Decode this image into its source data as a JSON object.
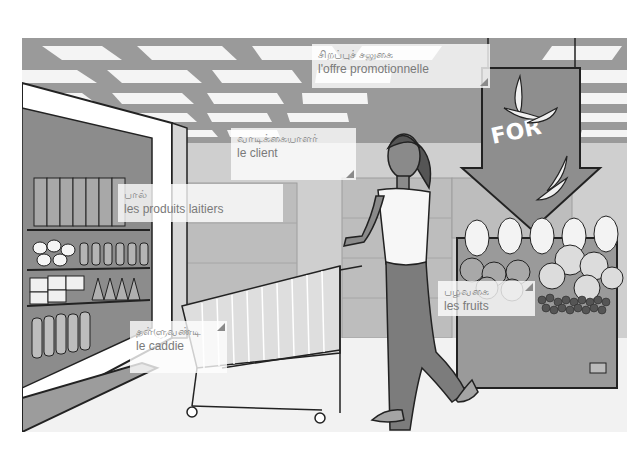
{
  "scene": {
    "description": "Supermarket illustration: woman pushing a shopping trolley past a dairy fridge and a fruit display under a promotional arrow sign",
    "sign_text": "FOR",
    "colors": {
      "ceiling_dark": "#9a9a9a",
      "ceiling_light": "#f4f4f4",
      "floor": "#f0f0f0",
      "shelf": "#8c8c8c",
      "sign": "#8e8e8e",
      "outline": "#222222"
    }
  },
  "labels": [
    {
      "id": "promo",
      "tamil": "சிறப்புச் சலுகை",
      "french": "l'offre promotionnelle",
      "x": 312,
      "y": 44,
      "w": 178,
      "h": 44
    },
    {
      "id": "client",
      "tamil": "வாடிக்கையாளர்",
      "french": "le client",
      "x": 231,
      "y": 128,
      "w": 125,
      "h": 52
    },
    {
      "id": "dairy",
      "tamil": "பால்",
      "french": "les produits laitiers",
      "x": 118,
      "y": 184,
      "w": 165,
      "h": 38
    },
    {
      "id": "caddie",
      "tamil": "தள்ளுவண்டி",
      "french": "le caddie",
      "x": 130,
      "y": 321,
      "w": 97,
      "h": 52
    },
    {
      "id": "fruits",
      "tamil": "பழவகை",
      "french": "les fruits",
      "x": 438,
      "y": 281,
      "w": 97,
      "h": 35
    }
  ]
}
